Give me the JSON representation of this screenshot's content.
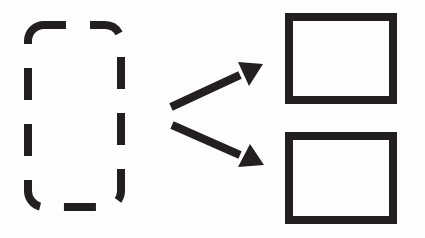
{
  "diagram": {
    "type": "split-icon",
    "colors": {
      "stroke": "#231f20",
      "background": "#fdfdfb"
    },
    "source": {
      "shape": "dashed-rounded-rectangle"
    },
    "arrows": [
      {
        "direction": "up-right"
      },
      {
        "direction": "down-right"
      }
    ],
    "targets": [
      {
        "shape": "solid-rectangle",
        "position": "top"
      },
      {
        "shape": "solid-rectangle",
        "position": "bottom"
      }
    ]
  }
}
